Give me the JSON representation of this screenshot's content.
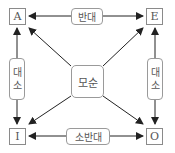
{
  "diagram": {
    "nodes": {
      "a": "A",
      "e": "E",
      "i": "I",
      "o": "O"
    },
    "relations": {
      "contrary": "반대",
      "subcontrary": "소반대",
      "contradictory": "모순",
      "subaltern_left_1": "대",
      "subaltern_left_2": "소",
      "subaltern_right_1": "대",
      "subaltern_right_2": "소"
    },
    "edges": [
      {
        "from": "A",
        "to": "E",
        "label": "반대",
        "type": "bidirectional"
      },
      {
        "from": "I",
        "to": "O",
        "label": "소반대",
        "type": "bidirectional"
      },
      {
        "from": "A",
        "to": "I",
        "label": "대소",
        "type": "bidirectional"
      },
      {
        "from": "E",
        "to": "O",
        "label": "대소",
        "type": "bidirectional"
      },
      {
        "from": "A",
        "to": "O",
        "label": "모순",
        "type": "bidirectional"
      },
      {
        "from": "E",
        "to": "I",
        "label": "모순",
        "type": "bidirectional"
      }
    ],
    "colors": {
      "line": "#222222",
      "box_border": "#8a8a8a",
      "text": "#555555"
    }
  }
}
